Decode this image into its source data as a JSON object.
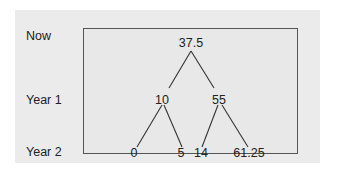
{
  "diagram": {
    "type": "binomial-tree",
    "row_labels": [
      "Now",
      "Year 1",
      "Year 2"
    ],
    "nodes": {
      "now": "37.5",
      "year1_down": "10",
      "year1_up": "55",
      "year2_dd": "0",
      "year2_du": "5",
      "year2_ud": "14",
      "year2_uu": "61.25"
    },
    "edges": [
      [
        "37.5",
        "10"
      ],
      [
        "37.5",
        "55"
      ],
      [
        "10",
        "0"
      ],
      [
        "10",
        "5"
      ],
      [
        "55",
        "14"
      ],
      [
        "55",
        "61.25"
      ]
    ],
    "colors": {
      "panel": "#ebebeb",
      "box_border": "#555555",
      "text": "#222222"
    }
  }
}
